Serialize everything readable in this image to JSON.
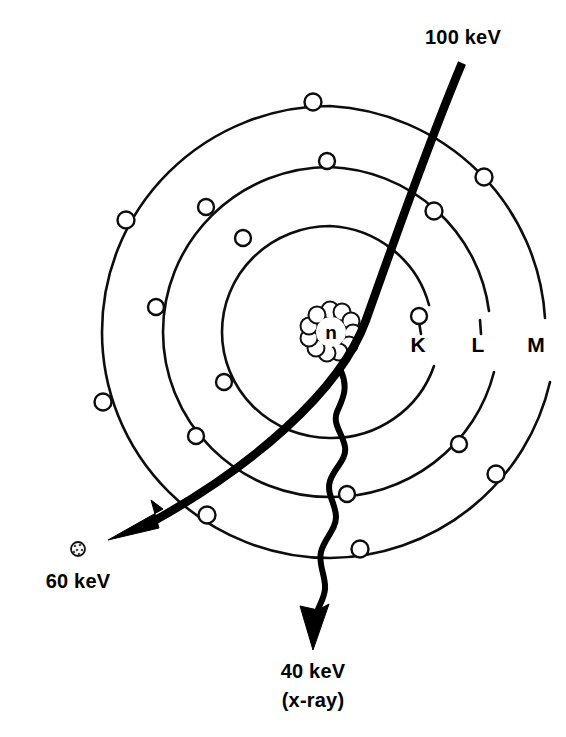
{
  "figure": {
    "kind": "bohr-atom-compton-scatter-diagram",
    "background_color": "#ffffff",
    "ink_color": "#000000"
  },
  "nucleus": {
    "symbol": "n",
    "cx": 330,
    "cy": 332,
    "lobe_count": 11,
    "cluster_radius": 22,
    "lobe_radius": 8.5
  },
  "shells": [
    {
      "id": "K",
      "label": "K",
      "label_x": 418,
      "label_y": 352,
      "rx": 108,
      "ry": 106,
      "electron_count": 3
    },
    {
      "id": "L",
      "label": "L",
      "label_x": 478,
      "label_y": 352,
      "rx": 167,
      "ry": 165,
      "electron_count": 6
    },
    {
      "id": "M",
      "label": "M",
      "label_x": 536,
      "label_y": 352,
      "rx": 228,
      "ry": 226,
      "electron_count": 8
    }
  ],
  "electrons": [
    {
      "shell": "K",
      "cx": 419,
      "cy": 316,
      "r": 8
    },
    {
      "shell": "K",
      "cx": 224,
      "cy": 382,
      "r": 8
    },
    {
      "shell": "K",
      "cx": 243,
      "cy": 238,
      "r": 8
    },
    {
      "shell": "L",
      "cx": 327,
      "cy": 161,
      "r": 8
    },
    {
      "shell": "L",
      "cx": 206,
      "cy": 207,
      "r": 8
    },
    {
      "shell": "L",
      "cx": 156,
      "cy": 307,
      "r": 8
    },
    {
      "shell": "L",
      "cx": 196,
      "cy": 436,
      "r": 8
    },
    {
      "shell": "L",
      "cx": 347,
      "cy": 494,
      "r": 8
    },
    {
      "shell": "L",
      "cx": 459,
      "cy": 444,
      "r": 8
    },
    {
      "shell": "M",
      "cx": 313,
      "cy": 102,
      "r": 8.5
    },
    {
      "shell": "M",
      "cx": 126,
      "cy": 220,
      "r": 8.5
    },
    {
      "shell": "M",
      "cx": 103,
      "cy": 402,
      "r": 8.5
    },
    {
      "shell": "M",
      "cx": 207,
      "cy": 515,
      "r": 8.5
    },
    {
      "shell": "M",
      "cx": 360,
      "cy": 549,
      "r": 8.5
    },
    {
      "shell": "M",
      "cx": 496,
      "cy": 474,
      "r": 8.5
    },
    {
      "shell": "M",
      "cx": 484,
      "cy": 177,
      "r": 8.5
    },
    {
      "shell": "M",
      "cx": 434,
      "cy": 211,
      "r": 8.5
    }
  ],
  "annotations": {
    "incident": {
      "label": "100 keV",
      "label_x": 463,
      "label_y": 44,
      "anchor": "middle"
    },
    "scattered_electron": {
      "label": "60 keV",
      "label_x": 78,
      "label_y": 588,
      "anchor": "middle",
      "dot_cx": 78,
      "dot_cy": 549,
      "dot_r": 7
    },
    "scattered_photon": {
      "label": "40 keV",
      "sublabel": "(x-ray)",
      "label_x": 313,
      "label_y": 678,
      "sublabel_x": 313,
      "sublabel_y": 707,
      "anchor": "middle"
    }
  }
}
